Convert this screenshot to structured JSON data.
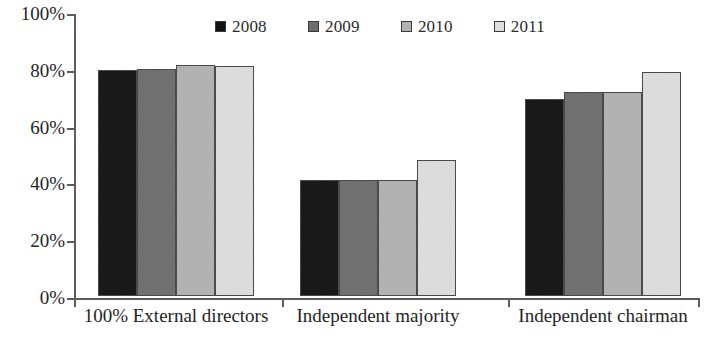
{
  "chart_data": {
    "type": "bar",
    "title": "",
    "subtitle": "",
    "xlabel": "",
    "ylabel": "",
    "ylim": [
      0,
      100
    ],
    "yticks": [
      0,
      20,
      40,
      60,
      80,
      100
    ],
    "ytick_labels": [
      "0%",
      "20%",
      "40%",
      "60%",
      "80%",
      "100%"
    ],
    "grid": false,
    "legend_position": "top-center",
    "value_format": "percent",
    "categories": [
      "100% External directors",
      "Independent majority",
      "Independent chairman"
    ],
    "series": [
      {
        "name": "2008",
        "color": "#111111",
        "values": [
          79.5,
          41.0,
          69.5
        ]
      },
      {
        "name": "2009",
        "color": "#6d6d6d",
        "values": [
          80.0,
          41.0,
          72.0
        ]
      },
      {
        "name": "2010",
        "color": "#b2b2b2",
        "values": [
          81.5,
          41.0,
          72.0
        ]
      },
      {
        "name": "2011",
        "color": "#dedede",
        "values": [
          81.0,
          48.0,
          79.0
        ]
      }
    ]
  },
  "legend": {
    "entries": [
      {
        "label": "2008",
        "color": "#111111"
      },
      {
        "label": "2009",
        "color": "#6d6d6d"
      },
      {
        "label": "2010",
        "color": "#b2b2b2"
      },
      {
        "label": "2011",
        "color": "#dedede"
      }
    ]
  },
  "axes": {
    "y": {
      "ticks": [
        {
          "label": "100%",
          "value": 100
        },
        {
          "label": "80%",
          "value": 80
        },
        {
          "label": "60%",
          "value": 60
        },
        {
          "label": "40%",
          "value": 40
        },
        {
          "label": "20%",
          "value": 20
        },
        {
          "label": "0%",
          "value": 0
        }
      ]
    },
    "x": {
      "categories": [
        "100% External directors",
        "Independent majority",
        "Independent chairman"
      ]
    }
  },
  "style": {
    "axis_color": "#5d5d5d",
    "bar_outline": "#4a4a4a",
    "background": "#ffffff",
    "text_color": "#1f1f1f"
  }
}
